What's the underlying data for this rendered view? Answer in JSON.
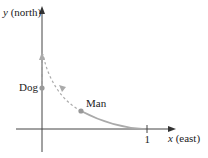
{
  "diagram": {
    "y_axis_label_var": "y",
    "y_axis_label_dir": "(north)",
    "x_axis_label_var": "x",
    "x_axis_label_dir": "(east)",
    "x_tick_label": "1",
    "dog_label": "Dog",
    "man_label": "Man",
    "colors": {
      "axis": "#444444",
      "path": "#aaaaaa",
      "dot": "#999999"
    }
  }
}
